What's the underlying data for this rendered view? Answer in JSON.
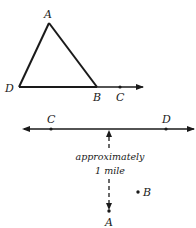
{
  "figure1": {
    "type": "triangle-with-ray",
    "points": {
      "A": {
        "label": "A",
        "x": 49,
        "y": 23
      },
      "D": {
        "label": "D",
        "x": 19,
        "y": 87
      },
      "B": {
        "label": "B",
        "x": 97,
        "y": 87
      },
      "C": {
        "label": "C",
        "x": 120,
        "y": 87
      }
    },
    "ray_end": {
      "x": 143,
      "y": 87
    }
  },
  "figure2": {
    "type": "line-with-perpendicular-distance",
    "line": {
      "y": 129,
      "x_start": 22,
      "x_end": 195
    },
    "points": {
      "C": {
        "label": "C",
        "x": 51,
        "y": 129
      },
      "D": {
        "label": "D",
        "x": 166,
        "y": 129
      },
      "A": {
        "label": "A",
        "x": 109,
        "y": 211
      },
      "B": {
        "label": "B",
        "x": 138,
        "y": 192
      }
    },
    "distance_label": {
      "line1": "approximately",
      "line2": "1 mile"
    },
    "colors": {
      "ink": "#1a1a1a"
    }
  }
}
